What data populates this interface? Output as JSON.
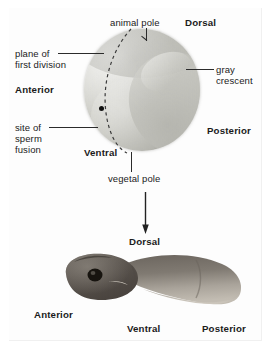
{
  "figure": {
    "background_color": "#fdfdfd",
    "text_color": "#1b1b1b",
    "accent_dark": "#2b2b2b"
  },
  "egg_panel": {
    "labels": {
      "animal_pole": "animal pole",
      "dorsal": "Dorsal",
      "plane_of_first_division_line1": "plane of",
      "plane_of_first_division_line2": "first division",
      "gray_crescent_line1": "gray",
      "gray_crescent_line2": "crescent",
      "anterior": "Anterior",
      "posterior": "Posterior",
      "site_of_sperm_fusion_line1": "site of",
      "site_of_sperm_fusion_line2": "sperm",
      "site_of_sperm_fusion_line3": "fusion",
      "ventral": "Ventral",
      "vegetal_pole": "vegetal pole"
    },
    "structures": {
      "egg_name": "amphibian-egg-sphere",
      "gray_crescent_name": "gray-crescent-band",
      "plane_name": "first-division-plane-dashed-arc",
      "sperm_entry_point_name": "sperm-fusion-point-marker"
    },
    "colors": {
      "egg_light": "#efefec",
      "egg_mid": "#cfcfc9",
      "egg_dark": "#a2a29b",
      "gray_crescent": "#767670"
    }
  },
  "transition": {
    "arrow_name": "development-arrow",
    "arrow_direction": "down"
  },
  "tadpole_panel": {
    "labels": {
      "dorsal": "Dorsal",
      "anterior": "Anterior",
      "ventral": "Ventral",
      "posterior": "Posterior"
    },
    "structures": {
      "organism_name": "tadpole-larva-photograph",
      "eye_name": "tadpole-eye"
    },
    "colors": {
      "body_dark": "#55504c",
      "body_mid": "#7d7872",
      "belly_light": "#b9b3aa"
    }
  }
}
